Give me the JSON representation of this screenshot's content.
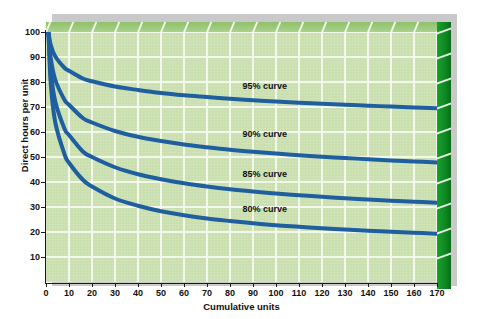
{
  "chart_data": {
    "type": "line",
    "title": "",
    "xlabel": "Cumulative units",
    "ylabel": "Direct hours per unit",
    "xlim": [
      0,
      170
    ],
    "ylim": [
      0,
      100
    ],
    "xticks": [
      0,
      10,
      20,
      30,
      40,
      50,
      60,
      70,
      80,
      90,
      100,
      110,
      120,
      130,
      140,
      150,
      160,
      170
    ],
    "yticks": [
      10,
      20,
      30,
      40,
      50,
      60,
      70,
      80,
      90,
      100
    ],
    "grid": true,
    "legend_position": "inline-annotations",
    "series": [
      {
        "name": "95% curve",
        "rate": 0.95,
        "color": "#1F5FA0",
        "label": "95% curve",
        "x": [
          1,
          2,
          4,
          8,
          10,
          16,
          20,
          30,
          40,
          50,
          60,
          70,
          80,
          90,
          100,
          110,
          120,
          130,
          140,
          150,
          160,
          170
        ],
        "y": [
          100.0,
          95.0,
          90.3,
          85.7,
          84.5,
          81.4,
          80.3,
          78.2,
          76.8,
          75.6,
          74.7,
          74.0,
          73.3,
          72.7,
          72.2,
          71.7,
          71.3,
          70.9,
          70.5,
          70.2,
          69.8,
          69.5
        ]
      },
      {
        "name": "90% curve",
        "rate": 0.9,
        "color": "#1F5FA0",
        "label": "90% curve",
        "x": [
          1,
          2,
          4,
          8,
          10,
          16,
          20,
          30,
          40,
          50,
          60,
          70,
          80,
          90,
          100,
          110,
          120,
          130,
          140,
          150,
          160,
          170
        ],
        "y": [
          100.0,
          90.0,
          81.0,
          72.9,
          70.9,
          65.6,
          63.8,
          60.4,
          58.1,
          56.4,
          55.0,
          53.9,
          52.9,
          52.1,
          51.4,
          50.7,
          50.1,
          49.6,
          49.1,
          48.6,
          48.2,
          47.8
        ]
      },
      {
        "name": "85% curve",
        "rate": 0.85,
        "color": "#1F5FA0",
        "label": "85% curve",
        "x": [
          1,
          2,
          4,
          8,
          10,
          16,
          20,
          30,
          40,
          50,
          60,
          70,
          80,
          90,
          100,
          110,
          120,
          130,
          140,
          150,
          160,
          170
        ],
        "y": [
          100.0,
          85.0,
          72.3,
          61.4,
          58.8,
          52.2,
          50.0,
          45.9,
          43.1,
          41.1,
          39.5,
          38.2,
          37.1,
          36.2,
          35.4,
          34.7,
          34.1,
          33.5,
          33.0,
          32.5,
          32.1,
          31.7
        ]
      },
      {
        "name": "80% curve",
        "rate": 0.8,
        "color": "#1F5FA0",
        "label": "80% curve",
        "x": [
          1,
          2,
          4,
          8,
          10,
          16,
          20,
          30,
          40,
          50,
          60,
          70,
          80,
          90,
          100,
          110,
          120,
          130,
          140,
          150,
          160,
          170
        ],
        "y": [
          100.0,
          80.0,
          64.0,
          51.2,
          47.7,
          40.9,
          38.2,
          33.4,
          30.5,
          28.3,
          26.7,
          25.4,
          24.4,
          23.5,
          22.7,
          22.1,
          21.5,
          21.0,
          20.5,
          20.1,
          19.7,
          19.3
        ]
      }
    ],
    "annotations": [
      {
        "text": "95% curve",
        "x": 95,
        "y": 78
      },
      {
        "text": "90% curve",
        "x": 95,
        "y": 59
      },
      {
        "text": "85% curve",
        "x": 95,
        "y": 43
      },
      {
        "text": "80% curve",
        "x": 95,
        "y": 29
      }
    ]
  },
  "axes": {
    "y_title": "Direct hours per unit",
    "x_title": "Cumulative units",
    "y_tick_labels": [
      "100",
      "90",
      "80",
      "70",
      "60",
      "50",
      "40",
      "30",
      "20",
      "10"
    ],
    "x_tick_labels": [
      "0",
      "10",
      "20",
      "30",
      "40",
      "50",
      "60",
      "70",
      "80",
      "90",
      "100",
      "110",
      "120",
      "130",
      "140",
      "150",
      "160",
      "170"
    ]
  },
  "curve_labels": {
    "c95": "95% curve",
    "c90": "90% curve",
    "c85": "85% curve",
    "c80": "80% curve"
  },
  "colors": {
    "curve_line": "#1F5FA0",
    "plot_background": "#c9dfae",
    "gridline": "#f4f9ef",
    "block_side": "#0f8a22",
    "block_top": "#a9d189",
    "shadow": "#c9c9c9",
    "page_background": "#ffffff",
    "text": "#111111"
  }
}
